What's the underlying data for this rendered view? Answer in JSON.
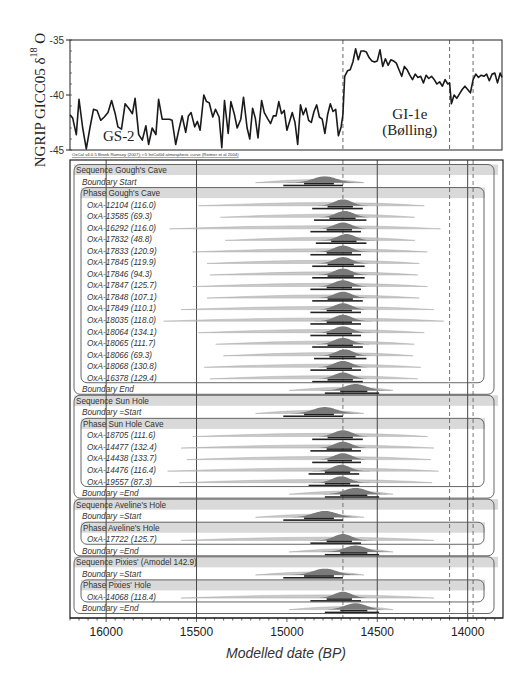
{
  "chart_data": [
    {
      "type": "line",
      "title": "",
      "ylabel": "NGRIP GICC05 δ18O",
      "ylabel_main": "NGRIP GICC05 δ",
      "ylabel_sup": "18",
      "ylabel_tail": " O",
      "ylim": [
        -45,
        -35
      ],
      "yticks": [
        -35,
        -40,
        -45
      ],
      "xlim": [
        16200,
        13810
      ],
      "region_labels": [
        {
          "text": "GS-2",
          "x": 15930,
          "y": -44.2
        },
        {
          "text": "GI-1e",
          "x": 14320,
          "y": -42.2
        },
        {
          "text": "(Bølling)",
          "x": 14320,
          "y": -43.6
        }
      ],
      "dashed_lines_x": [
        14690,
        14100,
        13970
      ],
      "series": [
        {
          "name": "NGRIP δ18O",
          "x": [
            16200,
            16185,
            16165,
            16150,
            16130,
            16110,
            16090,
            16070,
            16050,
            16030,
            16010,
            15990,
            15970,
            15950,
            15935,
            15915,
            15895,
            15875,
            15855,
            15840,
            15820,
            15800,
            15780,
            15765,
            15745,
            15725,
            15710,
            15690,
            15670,
            15650,
            15635,
            15615,
            15600,
            15580,
            15560,
            15545,
            15530,
            15510,
            15495,
            15480,
            15460,
            15445,
            15430,
            15410,
            15395,
            15375,
            15360,
            15345,
            15325,
            15310,
            15290,
            15275,
            15255,
            15240,
            15220,
            15205,
            15190,
            15175,
            15160,
            15140,
            15125,
            15105,
            15090,
            15075,
            15060,
            15045,
            15030,
            15015,
            15000,
            14985,
            14970,
            14955,
            14940,
            14925,
            14910,
            14895,
            14880,
            14865,
            14850,
            14835,
            14820,
            14805,
            14790,
            14775,
            14760,
            14745,
            14730,
            14715,
            14700,
            14690,
            14680,
            14665,
            14650,
            14635,
            14620,
            14605,
            14590,
            14575,
            14560,
            14545,
            14530,
            14515,
            14500,
            14485,
            14470,
            14455,
            14440,
            14425,
            14410,
            14395,
            14380,
            14365,
            14350,
            14335,
            14320,
            14305,
            14290,
            14275,
            14260,
            14245,
            14230,
            14215,
            14200,
            14185,
            14170,
            14155,
            14140,
            14125,
            14110,
            14100,
            14090,
            14075,
            14060,
            14045,
            14030,
            14015,
            14000,
            13985,
            13970,
            13955,
            13940,
            13925,
            13910,
            13895,
            13880,
            13865,
            13850,
            13835,
            13820,
            13810
          ],
          "values": [
            -41.8,
            -42.1,
            -43.6,
            -40.4,
            -43.0,
            -44.9,
            -43.0,
            -41.3,
            -41.4,
            -42.3,
            -42.0,
            -41.6,
            -40.5,
            -41.7,
            -42.9,
            -43.1,
            -40.8,
            -41.2,
            -41.7,
            -40.3,
            -43.6,
            -44.1,
            -42.8,
            -44.5,
            -43.0,
            -43.6,
            -40.4,
            -42.2,
            -42.2,
            -42.2,
            -42.3,
            -44.5,
            -43.3,
            -41.9,
            -43.4,
            -41.9,
            -41.6,
            -42.9,
            -42.4,
            -43.2,
            -40.0,
            -40.6,
            -40.7,
            -42.0,
            -41.3,
            -42.0,
            -44.8,
            -40.5,
            -43.5,
            -40.6,
            -41.8,
            -43.0,
            -42.2,
            -40.2,
            -43.0,
            -44.0,
            -41.2,
            -42.1,
            -43.9,
            -40.5,
            -41.6,
            -42.2,
            -42.6,
            -41.9,
            -41.9,
            -40.6,
            -41.7,
            -41.4,
            -43.2,
            -42.4,
            -41.6,
            -42.5,
            -44.5,
            -40.9,
            -41.8,
            -41.2,
            -42.3,
            -42.5,
            -41.5,
            -40.9,
            -42.0,
            -42.2,
            -43.5,
            -41.8,
            -40.8,
            -41.5,
            -41.3,
            -43.7,
            -42.9,
            -41.8,
            -38.3,
            -37.8,
            -37.7,
            -37.0,
            -35.8,
            -36.8,
            -36.0,
            -36.0,
            -36.1,
            -36.6,
            -36.9,
            -37.0,
            -36.9,
            -35.9,
            -37.4,
            -36.7,
            -37.3,
            -36.8,
            -36.9,
            -37.1,
            -37.7,
            -38.3,
            -37.4,
            -37.7,
            -38.2,
            -38.6,
            -38.1,
            -38.4,
            -38.3,
            -38.9,
            -38.2,
            -38.5,
            -38.3,
            -38.6,
            -39.0,
            -38.8,
            -39.2,
            -38.6,
            -39.0,
            -38.9,
            -40.8,
            -40.0,
            -40.3,
            -39.9,
            -39.5,
            -39.2,
            -39.5,
            -39.8,
            -38.6,
            -38.1,
            -38.4,
            -38.2,
            -38.3,
            -38.1,
            -38.7,
            -38.1,
            -38.0,
            -38.9,
            -38.0,
            -38.4
          ]
        }
      ]
    },
    {
      "type": "oxcal_multiplot",
      "xlabel": "Modelled date (BP)",
      "xlim": [
        16200,
        13810
      ],
      "xticks": [
        16000,
        15500,
        15000,
        14500,
        14000
      ],
      "minor_tick_step": 50,
      "solid_lines_x": [
        16000,
        15500,
        14500,
        14000
      ],
      "dashed_lines_x": [
        14690,
        14100,
        13970
      ],
      "rows": [
        {
          "kind": "sequence",
          "label": "Sequence Gough's Cave"
        },
        {
          "kind": "boundary",
          "label": "Boundary Start",
          "peak": 14790,
          "spread": 120,
          "prior_spread": 240,
          "range": [
            15020,
            14690
          ]
        },
        {
          "kind": "phase",
          "label": "Phase Gough's Cave"
        },
        {
          "kind": "date",
          "label": "OxA-12104 (116.0)",
          "peak": 14690,
          "spread": 90,
          "prior_spread": 500,
          "range": [
            14860,
            14580
          ]
        },
        {
          "kind": "date",
          "label": "OxA-13585 (69.3)",
          "peak": 14680,
          "spread": 90,
          "prior_spread": 430,
          "range": [
            14850,
            14560
          ]
        },
        {
          "kind": "date",
          "label": "OxA-16292 (116.0)",
          "peak": 14690,
          "spread": 90,
          "prior_spread": 600,
          "range": [
            14870,
            14590
          ]
        },
        {
          "kind": "date",
          "label": "OxA-17832 (48.8)",
          "peak": 14670,
          "spread": 90,
          "prior_spread": 420,
          "range": [
            14840,
            14560
          ]
        },
        {
          "kind": "date",
          "label": "OxA-17833 (120.9)",
          "peak": 14690,
          "spread": 90,
          "prior_spread": 520,
          "range": [
            14870,
            14590
          ]
        },
        {
          "kind": "date",
          "label": "OxA-17845 (119.9)",
          "peak": 14690,
          "spread": 90,
          "prior_spread": 470,
          "range": [
            14860,
            14570
          ]
        },
        {
          "kind": "date",
          "label": "OxA-17846 (94.3)",
          "peak": 14690,
          "spread": 90,
          "prior_spread": 460,
          "range": [
            14860,
            14570
          ]
        },
        {
          "kind": "date",
          "label": "OxA-17847 (125.7)",
          "peak": 14690,
          "spread": 90,
          "prior_spread": 520,
          "range": [
            14870,
            14590
          ]
        },
        {
          "kind": "date",
          "label": "OxA-17848 (107.1)",
          "peak": 14690,
          "spread": 90,
          "prior_spread": 470,
          "range": [
            14860,
            14580
          ]
        },
        {
          "kind": "date",
          "label": "OxA-17849 (110.1)",
          "peak": 14690,
          "spread": 90,
          "prior_spread": 560,
          "range": [
            14870,
            14590
          ]
        },
        {
          "kind": "date",
          "label": "OxA-18035 (118.0)",
          "peak": 14690,
          "spread": 90,
          "prior_spread": 620,
          "range": [
            14870,
            14590
          ]
        },
        {
          "kind": "date",
          "label": "OxA-18064 (134.1)",
          "peak": 14690,
          "spread": 90,
          "prior_spread": 500,
          "range": [
            14870,
            14590
          ]
        },
        {
          "kind": "date",
          "label": "OxA-18065 (111.7)",
          "peak": 14690,
          "spread": 90,
          "prior_spread": 440,
          "range": [
            14860,
            14580
          ]
        },
        {
          "kind": "date",
          "label": "OxA-18066 (69.3)",
          "peak": 14680,
          "spread": 90,
          "prior_spread": 420,
          "range": [
            14850,
            14560
          ]
        },
        {
          "kind": "date",
          "label": "OxA-18068 (130.8)",
          "peak": 14690,
          "spread": 90,
          "prior_spread": 480,
          "range": [
            14870,
            14590
          ]
        },
        {
          "kind": "date",
          "label": "OxA-16378 (129.4)",
          "peak": 14690,
          "spread": 90,
          "prior_spread": 460,
          "range": [
            14860,
            14580
          ]
        },
        {
          "kind": "boundary",
          "label": "Boundary End",
          "peak": 14620,
          "spread": 110,
          "prior_spread": 230,
          "range": [
            14790,
            14490
          ]
        },
        {
          "kind": "sequence",
          "label": "Sequence Sun Hole"
        },
        {
          "kind": "boundary",
          "label": "Boundary =Start",
          "peak": 14790,
          "spread": 120,
          "prior_spread": 240,
          "range": [
            15020,
            14690
          ]
        },
        {
          "kind": "phase",
          "label": "Phase Sun Hole Cave"
        },
        {
          "kind": "date",
          "label": "OxA-18705 (111.6)",
          "peak": 14690,
          "spread": 90,
          "prior_spread": 520,
          "range": [
            14860,
            14580
          ]
        },
        {
          "kind": "date",
          "label": "OxA-14477 (132.4)",
          "peak": 14690,
          "spread": 90,
          "prior_spread": 560,
          "range": [
            14870,
            14590
          ]
        },
        {
          "kind": "date",
          "label": "OxA-14438 (133.7)",
          "peak": 14690,
          "spread": 90,
          "prior_spread": 540,
          "range": [
            14860,
            14590
          ]
        },
        {
          "kind": "date",
          "label": "OxA-14476 (116.4)",
          "peak": 14700,
          "spread": 90,
          "prior_spread": 600,
          "range": [
            14880,
            14600
          ]
        },
        {
          "kind": "date",
          "label": "OxA-19557 (87.3)",
          "peak": 14700,
          "spread": 90,
          "prior_spread": 560,
          "range": [
            14880,
            14600
          ]
        },
        {
          "kind": "boundary",
          "label": "Boundary =End",
          "peak": 14620,
          "spread": 110,
          "prior_spread": 230,
          "range": [
            14790,
            14490
          ]
        },
        {
          "kind": "sequence",
          "label": "Sequence Aveline's Hole"
        },
        {
          "kind": "boundary",
          "label": "Boundary =Start",
          "peak": 14790,
          "spread": 120,
          "prior_spread": 240,
          "range": [
            15020,
            14690
          ]
        },
        {
          "kind": "phase",
          "label": "Phase Aveline's Hole"
        },
        {
          "kind": "date",
          "label": "OxA-17722 (125.7)",
          "peak": 14690,
          "spread": 90,
          "prior_spread": 560,
          "range": [
            14870,
            14590
          ]
        },
        {
          "kind": "boundary",
          "label": "Boundary =End",
          "peak": 14620,
          "spread": 110,
          "prior_spread": 230,
          "range": [
            14790,
            14490
          ]
        },
        {
          "kind": "sequence",
          "label": "Sequence Pixies' (Amodel 142.9)"
        },
        {
          "kind": "boundary",
          "label": "Boundary =Start",
          "peak": 14790,
          "spread": 120,
          "prior_spread": 240,
          "range": [
            15020,
            14690
          ]
        },
        {
          "kind": "phase",
          "label": "Phase Pixies' Hole"
        },
        {
          "kind": "date",
          "label": "OxA-14068 (118.4)",
          "peak": 14690,
          "spread": 90,
          "prior_spread": 560,
          "range": [
            14870,
            14590
          ]
        },
        {
          "kind": "boundary",
          "label": "Boundary =End",
          "peak": 14620,
          "spread": 110,
          "prior_spread": 230,
          "range": [
            14790,
            14490
          ]
        }
      ]
    }
  ],
  "credit": "OxCal v4.0.5 Bronk Ramsey (2007); r:5 IntCal04 atmospheric curve (Reimer et al 2004)",
  "colors": {
    "axis": "#222222",
    "curve": "#1a1a1a",
    "band": "#d9d9d9",
    "posterior": "#7a7a7a",
    "prior": "#bdbdbd",
    "range_bar": "#222222",
    "frame": "#555555"
  }
}
